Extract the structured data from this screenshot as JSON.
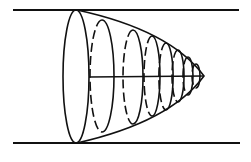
{
  "diagram": {
    "title": "",
    "colors": {
      "line": "#111111",
      "background": "#ffffff"
    },
    "walls": {
      "top": {
        "x1": 13,
        "x2": 239,
        "y": 10
      },
      "bottom": {
        "x1": 13,
        "x2": 240,
        "y": 143
      }
    },
    "profile": {
      "base_x": 76,
      "tip_x": 204,
      "axis_y": 77,
      "top_y": 10,
      "bottom_y": 143
    },
    "rings": [
      {
        "cx": 102,
        "ry": 56
      },
      {
        "cx": 133,
        "ry": 47
      },
      {
        "cx": 152,
        "ry": 40
      },
      {
        "cx": 166,
        "ry": 33
      },
      {
        "cx": 178,
        "ry": 26
      },
      {
        "cx": 188,
        "ry": 19
      },
      {
        "cx": 196,
        "ry": 12
      }
    ]
  }
}
